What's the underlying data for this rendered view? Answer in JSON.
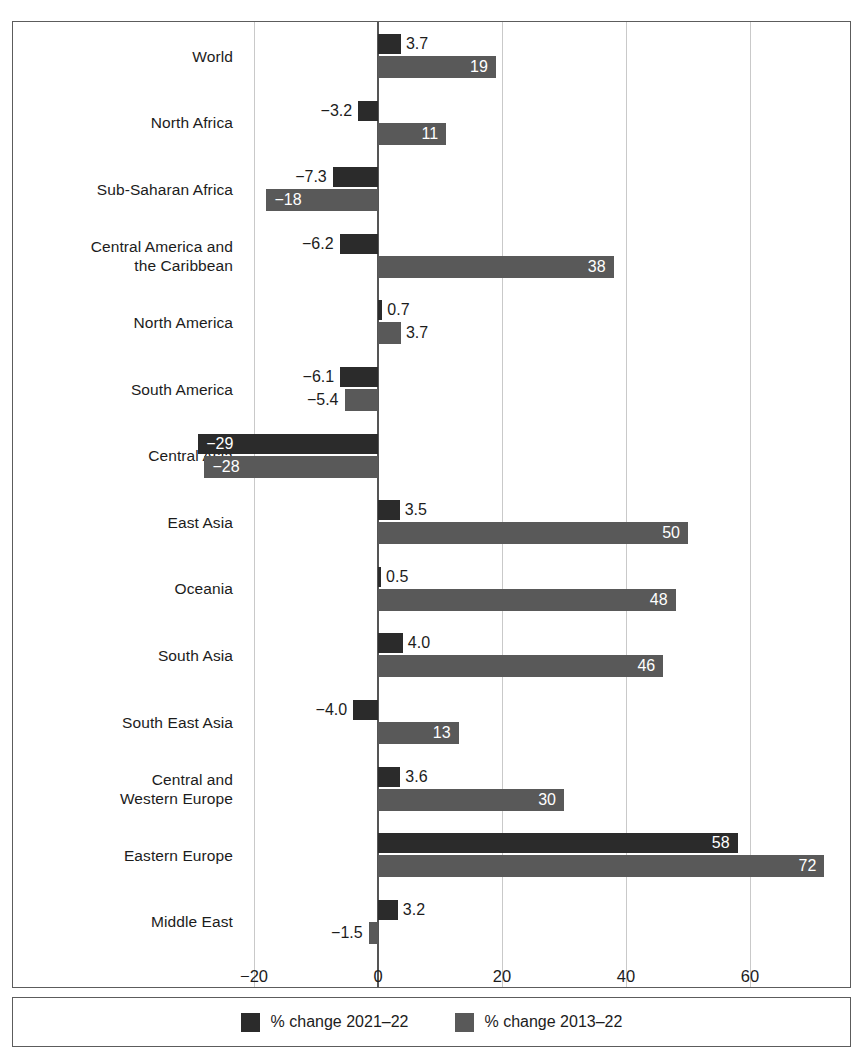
{
  "chart_data": {
    "type": "bar",
    "orientation": "horizontal",
    "title": "",
    "xlabel": "",
    "ylabel": "",
    "xlim": [
      -32,
      78
    ],
    "xticks": [
      -20,
      0,
      20,
      40,
      60
    ],
    "xtick_labels": [
      "−20",
      "0",
      "20",
      "40",
      "60"
    ],
    "grid": true,
    "legend_position": "bottom",
    "categories": [
      "World",
      "North Africa",
      "Sub-Saharan Africa",
      "Central America and\nthe Caribbean",
      "North America",
      "South America",
      "Central Asia",
      "East Asia",
      "Oceania",
      "South Asia",
      "South East Asia",
      "Central and\nWestern Europe",
      "Eastern Europe",
      "Middle East"
    ],
    "series": [
      {
        "name": "% change 2021–22",
        "color": "#2b2b2b",
        "values": [
          3.7,
          -3.2,
          -7.3,
          -6.2,
          0.7,
          -6.1,
          -29,
          3.5,
          0.5,
          4.0,
          -4.0,
          3.6,
          58,
          3.2
        ],
        "labels": [
          "3.7",
          "−3.2",
          "−7.3",
          "−6.2",
          "0.7",
          "−6.1",
          "−29",
          "3.5",
          "0.5",
          "4.0",
          "−4.0",
          "3.6",
          "58",
          "3.2"
        ]
      },
      {
        "name": "% change 2013–22",
        "color": "#595959",
        "values": [
          19,
          11,
          -18,
          38,
          3.7,
          -5.4,
          -28,
          50,
          48,
          46,
          13,
          30,
          72,
          -1.5
        ],
        "labels": [
          "19",
          "11",
          "−18",
          "38",
          "3.7",
          "−5.4",
          "−28",
          "50",
          "48",
          "46",
          "13",
          "30",
          "72",
          "−1.5"
        ]
      }
    ]
  },
  "legend": {
    "items": [
      {
        "label": "% change 2021–22",
        "color": "#2b2b2b"
      },
      {
        "label": "% change 2013–22",
        "color": "#595959"
      }
    ]
  },
  "colors": {
    "series1": "#2b2b2b",
    "series2": "#595959",
    "frame": "#5c5c5c",
    "gridline": "#c9c9c9",
    "zero_axis": "#555555",
    "text": "#1c1c1c",
    "inside_label": "#ffffff"
  }
}
